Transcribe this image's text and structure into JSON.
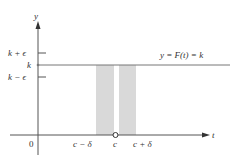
{
  "figure": {
    "axes": {
      "x_label": "t",
      "y_label": "y",
      "origin_label": "0"
    },
    "y_ticks": [
      {
        "label": "k + ϵ",
        "role": "upper-bound"
      },
      {
        "label": "k",
        "role": "value"
      },
      {
        "label": "k − ϵ",
        "role": "lower-bound"
      }
    ],
    "x_ticks": [
      {
        "label": "c − δ",
        "role": "left-bound"
      },
      {
        "label": "c",
        "role": "point"
      },
      {
        "label": "c + δ",
        "role": "right-bound"
      }
    ],
    "function_label": "y = F(t) = k",
    "colors": {
      "axis": "#555555",
      "line": "#777777",
      "shade": "#d9d9d9",
      "text": "#333333"
    }
  }
}
